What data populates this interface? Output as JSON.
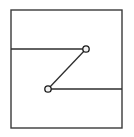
{
  "figure": {
    "canvas": {
      "width": 134,
      "height": 137,
      "background": "#ffffff"
    },
    "colors": {
      "frame_stroke": "#3a3a3a",
      "line_stroke": "#2e2e2e",
      "node_stroke": "#1a1a1a",
      "node_fill": "#f2f2f2"
    },
    "frame": {
      "label": "outer rectangle",
      "x": 11,
      "y": 10,
      "width": 111,
      "height": 118,
      "stroke_width": 1.4
    },
    "segments": [
      {
        "name": "upper-horizontal-segment",
        "label": "upper horizontal line",
        "x1": 11,
        "y1": 49,
        "x2": 86,
        "y2": 49,
        "stroke_width": 1.3
      },
      {
        "name": "diagonal-segment",
        "label": "diagonal connector",
        "x1": 86,
        "y1": 49,
        "x2": 48,
        "y2": 89,
        "stroke_width": 1.3
      },
      {
        "name": "lower-horizontal-segment",
        "label": "lower horizontal line",
        "x1": 48,
        "y1": 89,
        "x2": 122,
        "y2": 89,
        "stroke_width": 1.3
      }
    ],
    "nodes": [
      {
        "name": "upper-node",
        "label": "upper vertex",
        "cx": 86,
        "cy": 49,
        "r": 3.2,
        "stroke_width": 1.3
      },
      {
        "name": "lower-node",
        "label": "lower vertex",
        "cx": 48,
        "cy": 89,
        "r": 3.2,
        "stroke_width": 1.3
      }
    ]
  }
}
